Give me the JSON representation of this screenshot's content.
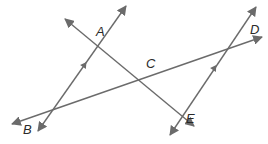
{
  "diagram": {
    "type": "geometry",
    "colors": {
      "line": "#6b6b6b",
      "label": "#2a2a2a",
      "background": "#ffffff"
    },
    "points": {
      "A": {
        "label": "A",
        "x": 100,
        "y": 42,
        "label_x": 96,
        "label_y": 36
      },
      "B": {
        "label": "B",
        "x": 53,
        "y": 115,
        "label_x": 23,
        "label_y": 134
      },
      "C": {
        "label": "C",
        "x": 150,
        "y": 71,
        "label_x": 146,
        "label_y": 68
      },
      "D": {
        "label": "D",
        "x": 243,
        "y": 44,
        "label_x": 250,
        "label_y": 34
      },
      "E": {
        "label": "E",
        "x": 185,
        "y": 100,
        "label_x": 186,
        "label_y": 123
      }
    },
    "lines": [
      {
        "id": "line-AB",
        "through": [
          "A",
          "B"
        ],
        "x1": 38,
        "y1": 131,
        "x2": 126,
        "y2": 6,
        "parallel_marker": true,
        "marker_x": 83,
        "marker_y": 67
      },
      {
        "id": "line-DE",
        "through": [
          "D",
          "E"
        ],
        "x1": 170,
        "y1": 135,
        "x2": 256,
        "y2": 7,
        "parallel_marker": true,
        "marker_x": 213,
        "marker_y": 70
      },
      {
        "id": "line-AE",
        "through": [
          "A",
          "C",
          "E"
        ],
        "x1": 65,
        "y1": 19,
        "x2": 194,
        "y2": 126,
        "parallel_marker": false
      },
      {
        "id": "line-BD",
        "through": [
          "B",
          "C",
          "D"
        ],
        "x1": 12,
        "y1": 124,
        "x2": 262,
        "y2": 37,
        "parallel_marker": false
      }
    ]
  }
}
